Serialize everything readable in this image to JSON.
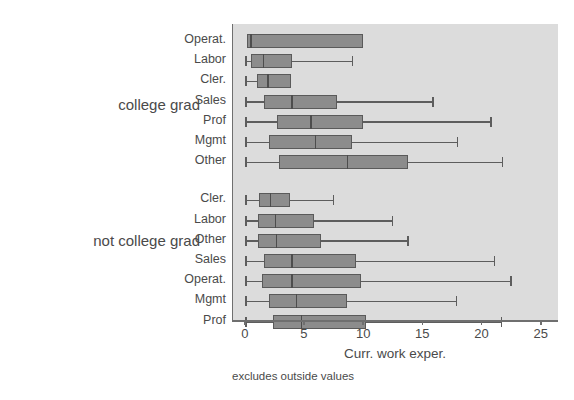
{
  "chart_data": {
    "type": "box",
    "title": "",
    "xlabel": "Curr. work exper.",
    "ylabel": "",
    "note": "excludes outside values",
    "xlim": [
      0,
      25
    ],
    "xticks": [
      0,
      5,
      10,
      15,
      20,
      25
    ],
    "xtick_labels": [
      "0",
      "5",
      "10",
      "15",
      "20",
      "25"
    ],
    "grid": false,
    "legend": "none",
    "plot_bgcolor": "#dcdcdc",
    "box_fill_color": "#8c8c8c",
    "box_line_color": "#5a5a5a",
    "groups": [
      {
        "label": "college grad",
        "boxes": [
          {
            "category": "Operat.",
            "whisker_low": 0.2,
            "q1": 0.2,
            "median": 0.45,
            "q3": 10.0,
            "whisker_high": 10.0
          },
          {
            "category": "Labor",
            "whisker_low": 0.0,
            "q1": 0.5,
            "median": 1.5,
            "q3": 4.0,
            "whisker_high": 9.0
          },
          {
            "category": "Cler.",
            "whisker_low": 0.0,
            "q1": 1.0,
            "median": 1.9,
            "q3": 3.9,
            "whisker_high": 3.9
          },
          {
            "category": "Sales",
            "whisker_low": 0.0,
            "q1": 1.6,
            "median": 3.9,
            "q3": 7.8,
            "whisker_high": 15.8
          },
          {
            "category": "Prof",
            "whisker_low": 0.0,
            "q1": 2.7,
            "median": 5.5,
            "q3": 10.0,
            "whisker_high": 20.7
          },
          {
            "category": "Mgmt",
            "whisker_low": 0.0,
            "q1": 2.0,
            "median": 5.9,
            "q3": 9.0,
            "whisker_high": 17.9
          },
          {
            "category": "Other",
            "whisker_low": 0.0,
            "q1": 2.9,
            "median": 8.6,
            "q3": 13.8,
            "whisker_high": 21.7
          }
        ]
      },
      {
        "label": "not college grad",
        "boxes": [
          {
            "category": "Cler.",
            "whisker_low": 0.0,
            "q1": 1.2,
            "median": 2.1,
            "q3": 3.8,
            "whisker_high": 7.4
          },
          {
            "category": "Labor",
            "whisker_low": 0.0,
            "q1": 1.1,
            "median": 2.5,
            "q3": 5.8,
            "whisker_high": 12.4
          },
          {
            "category": "Other",
            "whisker_low": 0.0,
            "q1": 1.1,
            "median": 2.6,
            "q3": 6.4,
            "whisker_high": 13.7
          },
          {
            "category": "Sales",
            "whisker_low": 0.0,
            "q1": 1.6,
            "median": 3.9,
            "q3": 9.4,
            "whisker_high": 21.0
          },
          {
            "category": "Operat.",
            "whisker_low": 0.0,
            "q1": 1.4,
            "median": 3.9,
            "q3": 9.8,
            "whisker_high": 22.4
          },
          {
            "category": "Mgmt",
            "whisker_low": 0.0,
            "q1": 2.0,
            "median": 4.3,
            "q3": 8.6,
            "whisker_high": 17.8
          },
          {
            "category": "Prof",
            "whisker_low": 0.0,
            "q1": 2.4,
            "median": 4.7,
            "q3": 10.2,
            "whisker_high": 21.6
          }
        ]
      }
    ]
  }
}
